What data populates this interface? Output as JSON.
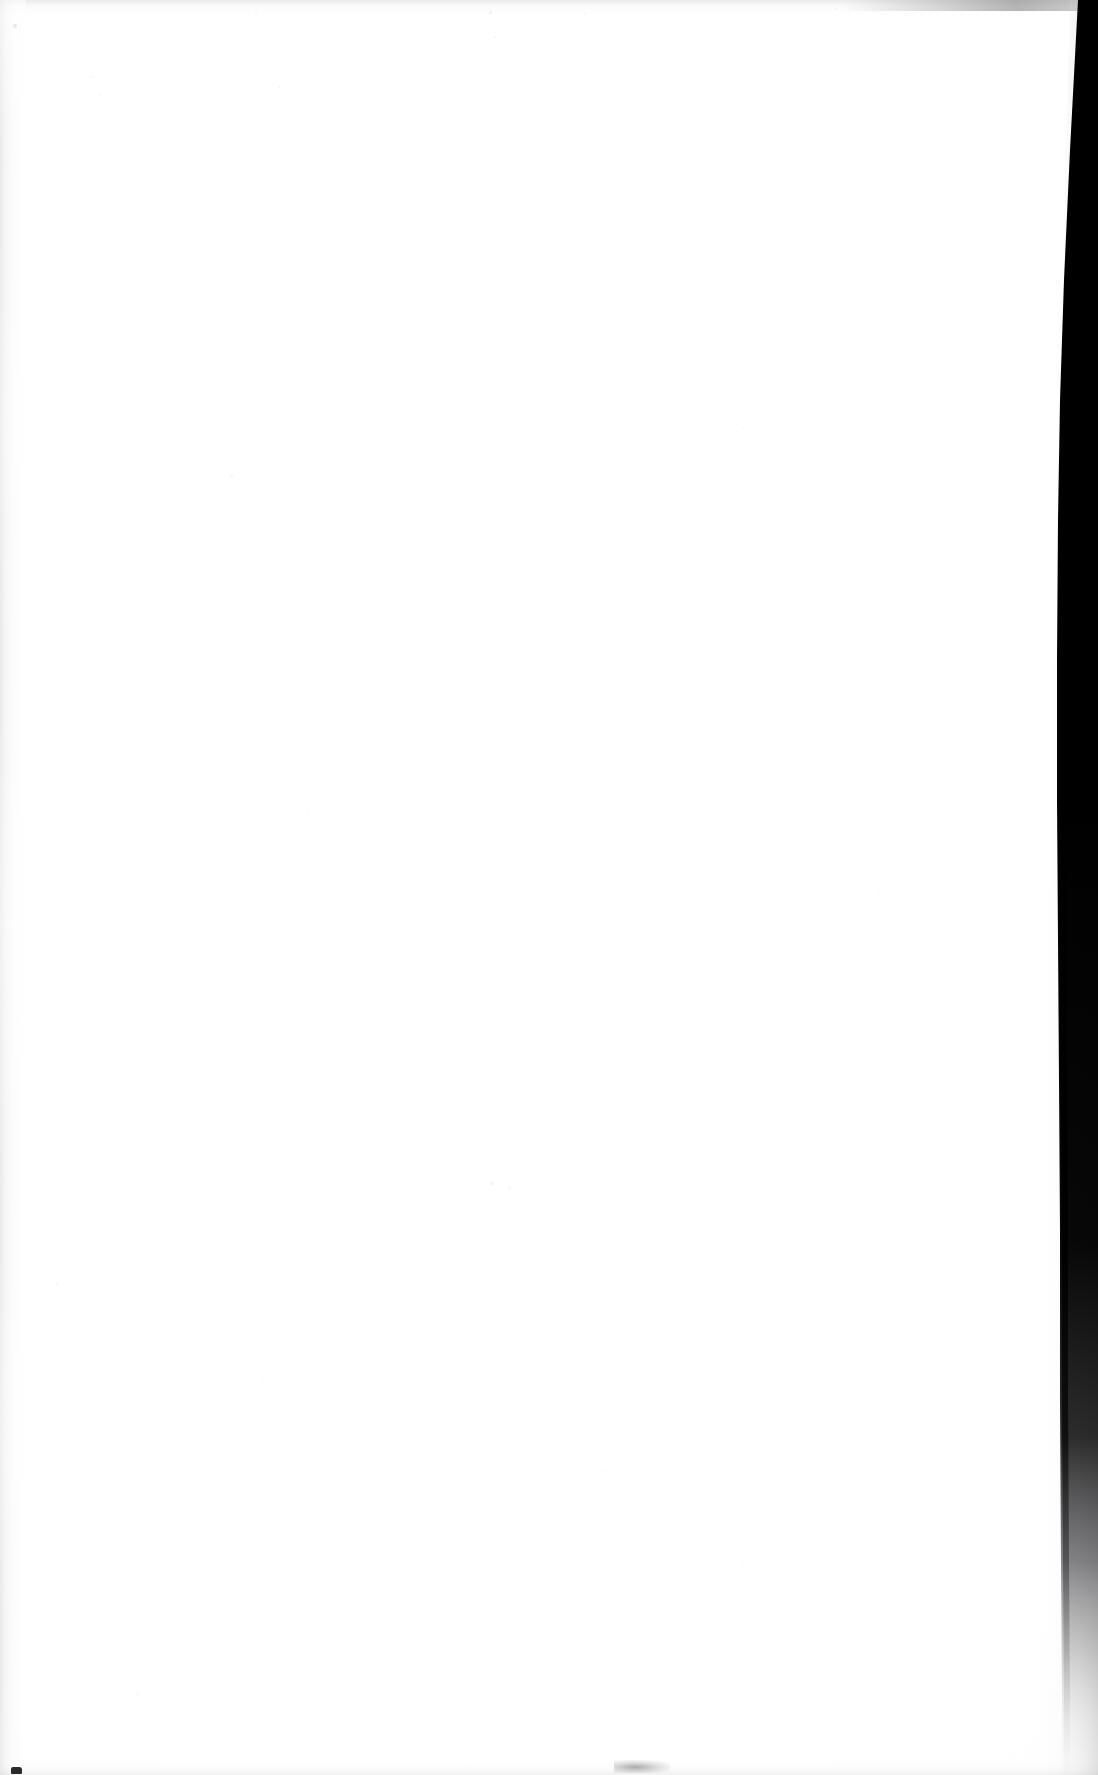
{
  "document": {
    "kind": "scanned-page",
    "title": "Scanned blank page",
    "page_width": 1098,
    "page_height": 1775,
    "content_text": "",
    "content_note": "No printed or handwritten text is present on this page.",
    "paper_color": "#ffffff",
    "background_color": "#ffffff"
  },
  "artifacts": {
    "gutter_shadow": {
      "name": "right-edge binding shadow",
      "color": "#000000",
      "description": "Dark near-black vertical sliver along the right edge, widest at the top and tapering to a hairline that fades out near the bottom.",
      "top_left_x": 1085,
      "top_right_x": 1098,
      "mid_left_x": 1062,
      "mid_right_x": 1082,
      "fade_start_y": 1450,
      "fade_end_y": 1740
    },
    "left_edge_streak": {
      "name": "left scanner edge streak",
      "color": "#9a9a9c",
      "width": 26
    },
    "top_edge_streak": {
      "name": "top scanner edge smudge",
      "color": "#60606 3",
      "height": 15
    },
    "bottom_edge_streak": {
      "name": "bottom scanner edge streak",
      "color": "#aaaaad",
      "height": 14
    },
    "corner_dot": {
      "name": "bottom-left corner dot",
      "color": "#2a2a2c",
      "x": 11,
      "y": 1767
    },
    "bottom_smudge": {
      "name": "bottom-centre smudge",
      "color": "#68686c",
      "x": 635,
      "y": 1767
    },
    "specks": [
      {
        "x": 13,
        "y": 24,
        "size": 4,
        "opacity": 0.3
      },
      {
        "x": 92,
        "y": 76,
        "size": 2,
        "opacity": 0.16
      },
      {
        "x": 255,
        "y": 13,
        "size": 2,
        "opacity": 0.14
      },
      {
        "x": 186,
        "y": 39,
        "size": 2,
        "opacity": 0.12
      },
      {
        "x": 99,
        "y": 93,
        "size": 2,
        "opacity": 0.13
      },
      {
        "x": 278,
        "y": 86,
        "size": 2,
        "opacity": 0.11
      },
      {
        "x": 489,
        "y": 11,
        "size": 3,
        "opacity": 0.22
      },
      {
        "x": 494,
        "y": 36,
        "size": 2,
        "opacity": 0.15
      },
      {
        "x": 584,
        "y": 13,
        "size": 2,
        "opacity": 0.12
      },
      {
        "x": 663,
        "y": 92,
        "size": 2,
        "opacity": 0.13
      },
      {
        "x": 835,
        "y": 8,
        "size": 2,
        "opacity": 0.17
      },
      {
        "x": 230,
        "y": 474,
        "size": 3,
        "opacity": 0.14
      },
      {
        "x": 201,
        "y": 527,
        "size": 2,
        "opacity": 0.11
      },
      {
        "x": 465,
        "y": 620,
        "size": 2,
        "opacity": 0.1
      },
      {
        "x": 742,
        "y": 427,
        "size": 2,
        "opacity": 0.09
      },
      {
        "x": 878,
        "y": 889,
        "size": 2,
        "opacity": 0.1
      },
      {
        "x": 308,
        "y": 812,
        "size": 2,
        "opacity": 0.11
      },
      {
        "x": 785,
        "y": 979,
        "size": 2,
        "opacity": 0.09
      },
      {
        "x": 490,
        "y": 1181,
        "size": 4,
        "opacity": 0.14
      },
      {
        "x": 508,
        "y": 1186,
        "size": 3,
        "opacity": 0.1
      },
      {
        "x": 56,
        "y": 1283,
        "size": 2,
        "opacity": 0.12
      },
      {
        "x": 262,
        "y": 1381,
        "size": 2,
        "opacity": 0.1
      },
      {
        "x": 604,
        "y": 1470,
        "size": 2,
        "opacity": 0.09
      },
      {
        "x": 911,
        "y": 1329,
        "size": 2,
        "opacity": 0.09
      },
      {
        "x": 742,
        "y": 1561,
        "size": 2,
        "opacity": 0.1
      },
      {
        "x": 136,
        "y": 1693,
        "size": 2,
        "opacity": 0.11
      },
      {
        "x": 464,
        "y": 1767,
        "size": 2,
        "opacity": 0.13
      }
    ]
  }
}
